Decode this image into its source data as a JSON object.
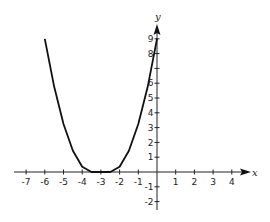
{
  "chart_data": {
    "type": "line",
    "title": "",
    "xlabel": "x",
    "ylabel": "y",
    "xlim": [
      -7.5,
      5
    ],
    "ylim": [
      -2.3,
      9.8
    ],
    "grid": false,
    "legend": null,
    "x_ticks": [
      -7,
      -6,
      -5,
      -4,
      -3,
      -2,
      -1,
      1,
      2,
      3,
      4
    ],
    "y_ticks": [
      9,
      8,
      7,
      6,
      5,
      4,
      3,
      2,
      1,
      -1,
      -2
    ],
    "y_tick_labels_visible": [
      "9",
      "8",
      "6",
      "5",
      "4",
      "3",
      "2",
      "1",
      "-1",
      "-2"
    ],
    "series": [
      {
        "name": "curve",
        "x": [
          -6,
          -5.5,
          -5,
          -4.5,
          -4,
          -3.5,
          -2.5,
          -2,
          -1.5,
          -1,
          -0.5,
          0
        ],
        "y": [
          9,
          5.76,
          3.24,
          1.44,
          0.36,
          0,
          0,
          0.36,
          1.44,
          3.24,
          5.76,
          9
        ]
      }
    ],
    "line_color": "#111111"
  },
  "axes": {
    "x_label": "x",
    "y_label": "y"
  }
}
